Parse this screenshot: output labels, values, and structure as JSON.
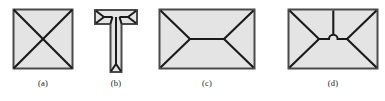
{
  "panel": {
    "name": "four-part-figure-panel",
    "background_color": "#ffffff",
    "stroke_color": "#1a1a1a",
    "fill_color": "#e4e4e4",
    "outline_color": "#3d3d3d",
    "caption_color": "#1a1a1a",
    "top_artifact_text": "·  ·· ·  · ····· ··"
  },
  "figures": [
    {
      "id": "figure-a",
      "caption": "(a)",
      "shape": "square-with-crossed-diagonals",
      "description": "Square outline with both diagonals drawn, forming an X that divides it into four triangles",
      "x": 12,
      "y": 8,
      "width": 62,
      "height": 62,
      "caption_y": 78
    },
    {
      "id": "figure-b",
      "caption": "(b)",
      "shape": "t-shape-with-chamfered-skeleton",
      "description": "T-shaped polygon with internal bevel lines running from each corner toward the stem",
      "x": 93,
      "y": 8,
      "width": 46,
      "height": 66,
      "caption_y": 78
    },
    {
      "id": "figure-c",
      "caption": "(c)",
      "shape": "rectangle-with-hip-roof-skeleton",
      "description": "Rectangle with four corner bevel lines meeting a central horizontal ridge line",
      "x": 158,
      "y": 8,
      "width": 98,
      "height": 62,
      "caption_y": 78
    },
    {
      "id": "figure-d",
      "caption": "(d)",
      "shape": "rectangle-with-skeleton-and-notch",
      "description": "Rectangle with corner bevel lines meeting a central ridge that has a small semicircular notch and a vertical line rising to the top edge",
      "x": 287,
      "y": 8,
      "width": 92,
      "height": 62,
      "caption_y": 78
    }
  ]
}
